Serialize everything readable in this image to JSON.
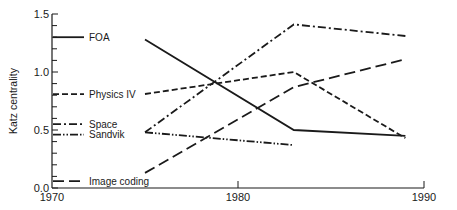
{
  "chart_data": {
    "type": "line",
    "title": "",
    "xlabel": "",
    "ylabel": "Katz centrality",
    "xlim": [
      1970,
      1990
    ],
    "ylim": [
      0.0,
      1.5
    ],
    "x_ticks": [
      1970,
      1980,
      1990
    ],
    "x_tick_labels": [
      "1970",
      "1980",
      "1990"
    ],
    "y_ticks": [
      0.0,
      0.5,
      1.0,
      1.5
    ],
    "y_tick_labels": [
      "0.0",
      "0.5",
      "1.0",
      "1.5"
    ],
    "y_minor_step": 0.1,
    "grid": false,
    "legend_position": "inline-left",
    "series": [
      {
        "name": "FOA",
        "style": "solid",
        "legend_y": 1.3,
        "x": [
          1975,
          1983,
          1989
        ],
        "values": [
          1.28,
          0.5,
          0.45
        ]
      },
      {
        "name": "Physics IV",
        "style": "dashed",
        "legend_y": 0.81,
        "x": [
          1975,
          1983,
          1989
        ],
        "values": [
          0.81,
          1.0,
          0.43
        ]
      },
      {
        "name": "Space",
        "style": "dash-dot",
        "legend_y": 0.55,
        "x": [
          1975,
          1983,
          1989
        ],
        "values": [
          0.48,
          1.41,
          1.31
        ]
      },
      {
        "name": "Sandvik",
        "style": "dash-dot-dot",
        "legend_y": 0.46,
        "x": [
          1975,
          1983
        ],
        "values": [
          0.48,
          0.37
        ]
      },
      {
        "name": "Image coding",
        "style": "long-dash",
        "legend_y": 0.06,
        "x": [
          1975,
          1983,
          1989
        ],
        "values": [
          0.13,
          0.87,
          1.11
        ]
      }
    ]
  }
}
